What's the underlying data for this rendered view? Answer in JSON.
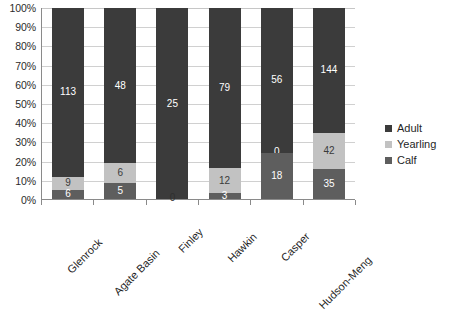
{
  "chart_data": {
    "type": "bar",
    "subtype": "stacked-100-percent",
    "title": "",
    "xlabel": "",
    "ylabel": "",
    "ylim": [
      0,
      100
    ],
    "ytick_labels": [
      "100%",
      "90%",
      "80%",
      "70%",
      "60%",
      "50%",
      "40%",
      "30%",
      "20%",
      "10%",
      "0%"
    ],
    "ytick_values": [
      100,
      90,
      80,
      70,
      60,
      50,
      40,
      30,
      20,
      10,
      0
    ],
    "grid": true,
    "grid_axis": "y",
    "legend_position": "right",
    "categories": [
      "Glenrock",
      "Agate Basin",
      "Finley",
      "Hawkin",
      "Casper",
      "Hudson-Meng"
    ],
    "series": [
      {
        "name": "Calf",
        "color": "#5e5e5e",
        "values": [
          6,
          5,
          0,
          3,
          18,
          35
        ]
      },
      {
        "name": "Yearling",
        "color": "#c2c2c2",
        "values": [
          9,
          6,
          0,
          12,
          0,
          42
        ]
      },
      {
        "name": "Adult",
        "color": "#3b3b3b",
        "values": [
          113,
          48,
          25,
          79,
          56,
          144
        ]
      }
    ],
    "totals": [
      128,
      59,
      25,
      94,
      74,
      221
    ],
    "bars": [
      {
        "category": "Glenrock",
        "total": 128,
        "segments": [
          {
            "series": "Calf",
            "value": 6,
            "label": "6",
            "percent": 4.7
          },
          {
            "series": "Yearling",
            "value": 9,
            "label": "9",
            "percent": 7.0
          },
          {
            "series": "Adult",
            "value": 113,
            "label": "113",
            "percent": 88.3
          }
        ]
      },
      {
        "category": "Agate Basin",
        "total": 59,
        "segments": [
          {
            "series": "Calf",
            "value": 5,
            "label": "5",
            "percent": 8.5
          },
          {
            "series": "Yearling",
            "value": 6,
            "label": "6",
            "percent": 10.2
          },
          {
            "series": "Adult",
            "value": 48,
            "label": "48",
            "percent": 81.4
          }
        ]
      },
      {
        "category": "Finley",
        "total": 25,
        "segments": [
          {
            "series": "Calf",
            "value": 0,
            "label": "0",
            "percent": 0
          },
          {
            "series": "Yearling",
            "value": 0,
            "label": "",
            "percent": 0
          },
          {
            "series": "Adult",
            "value": 25,
            "label": "25",
            "percent": 100
          }
        ]
      },
      {
        "category": "Hawkin",
        "total": 94,
        "segments": [
          {
            "series": "Calf",
            "value": 3,
            "label": "3",
            "percent": 3.2
          },
          {
            "series": "Yearling",
            "value": 12,
            "label": "12",
            "percent": 12.8
          },
          {
            "series": "Adult",
            "value": 79,
            "label": "79",
            "percent": 84.0
          }
        ]
      },
      {
        "category": "Casper",
        "total": 74,
        "segments": [
          {
            "series": "Calf",
            "value": 18,
            "label": "18",
            "percent": 24.3
          },
          {
            "series": "Yearling",
            "value": 0,
            "label": "0",
            "percent": 0
          },
          {
            "series": "Adult",
            "value": 56,
            "label": "56",
            "percent": 75.7
          }
        ]
      },
      {
        "category": "Hudson-Meng",
        "total": 221,
        "segments": [
          {
            "series": "Calf",
            "value": 35,
            "label": "35",
            "percent": 15.8
          },
          {
            "series": "Yearling",
            "value": 42,
            "label": "42",
            "percent": 19.0
          },
          {
            "series": "Adult",
            "value": 144,
            "label": "144",
            "percent": 65.2
          }
        ]
      }
    ],
    "legend": [
      {
        "label": "Adult",
        "color": "#3b3b3b"
      },
      {
        "label": "Yearling",
        "color": "#c2c2c2"
      },
      {
        "label": "Calf",
        "color": "#5e5e5e"
      }
    ]
  }
}
